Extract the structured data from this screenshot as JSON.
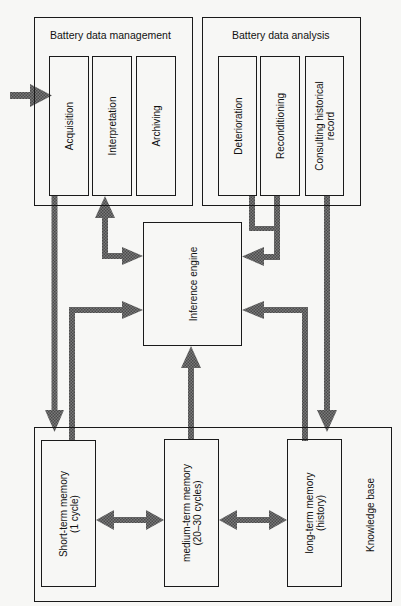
{
  "diagram": {
    "management": {
      "title": "Battery data management",
      "modules": [
        {
          "label": "Acquisition"
        },
        {
          "label": "Interpretation"
        },
        {
          "label": "Archiving"
        }
      ]
    },
    "analysis": {
      "title": "Battery data analysis",
      "modules": [
        {
          "label": "Deterioration"
        },
        {
          "label": "Reconditioning"
        },
        {
          "label_line1": "Consulting historical",
          "label_line2": "record"
        }
      ]
    },
    "engine": {
      "label": "Inference engine"
    },
    "knowledge_base": {
      "title": "Knowledge base",
      "memories": [
        {
          "line1": "Short-term memory",
          "line2": "(1 cycle)"
        },
        {
          "line1": "medium-term memory",
          "line2": "(20–30 cycles)"
        },
        {
          "line1": "long-term memory",
          "line2": "(history)"
        }
      ]
    },
    "colors": {
      "line": "#1a1a1a",
      "arrow": "#6e6e6e",
      "background": "#f7f7f5"
    }
  }
}
